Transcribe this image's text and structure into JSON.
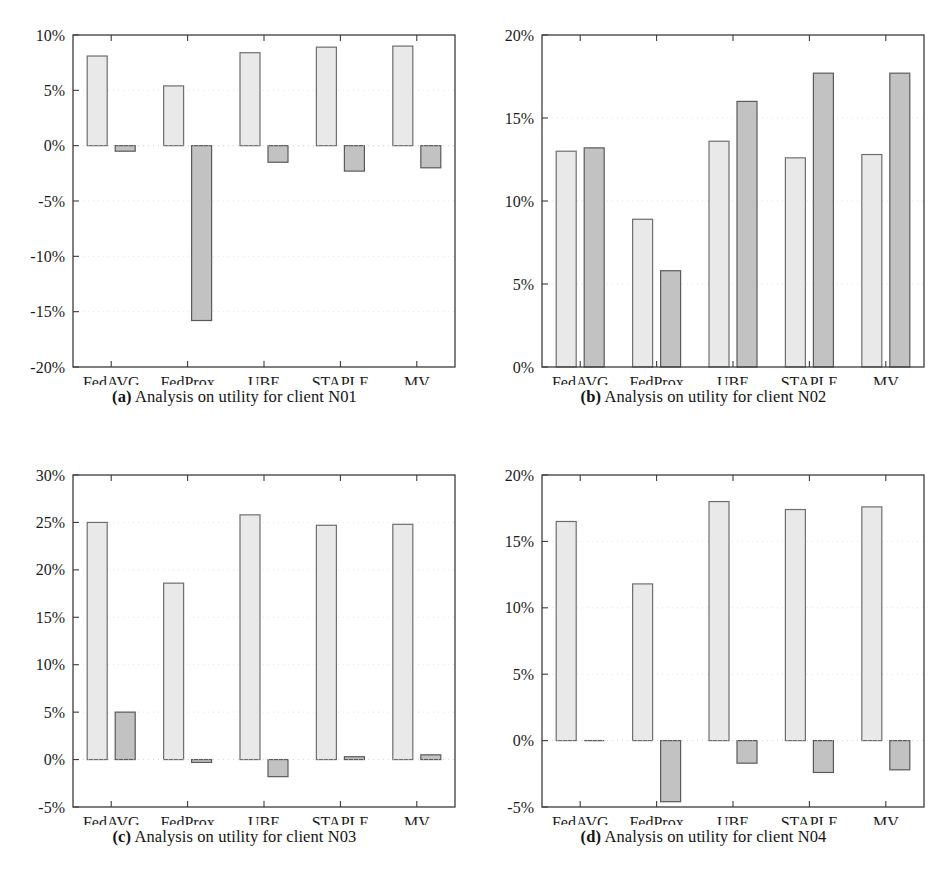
{
  "figure": {
    "panel_count": 4,
    "group_labels": [
      "FedAVG",
      "FedProx",
      "UBE",
      "STAPLE",
      "MV"
    ],
    "colors": {
      "series_light_fill": "#e9e9e9",
      "series_light_stroke": "#6e6e6e",
      "series_dark_fill": "#c2c2c2",
      "series_dark_stroke": "#5a5a5a",
      "axis": "#3c3c3c",
      "gridline": "#cfcfcf",
      "text": "#1a1a1a"
    }
  },
  "panels": [
    {
      "key": "a",
      "caption_tag": "(a)",
      "caption_text": "Analysis on utility for client N01",
      "chart_data": {
        "type": "bar",
        "title": "Analysis on utility for client N01",
        "xlabel": "",
        "ylabel": "",
        "categories": [
          "FedAVG",
          "FedProx",
          "UBE",
          "STAPLE",
          "MV"
        ],
        "series": [
          {
            "name": "series-light",
            "values": [
              8.1,
              5.4,
              8.4,
              8.9,
              9.0
            ]
          },
          {
            "name": "series-dark",
            "values": [
              -0.5,
              -15.8,
              -1.5,
              -2.3,
              -2.0
            ]
          }
        ],
        "ylim": [
          -20,
          10
        ],
        "ytick_values": [
          10,
          5,
          0,
          -5,
          -10,
          -15,
          -20
        ],
        "ytick_labels": [
          "10%",
          "5%",
          "0%",
          "-5%",
          "-10%",
          "-15%",
          "-20%"
        ],
        "grid": true,
        "legend": "none"
      }
    },
    {
      "key": "b",
      "caption_tag": "(b)",
      "caption_text": "Analysis on utility for client N02",
      "chart_data": {
        "type": "bar",
        "title": "Analysis on utility for client N02",
        "xlabel": "",
        "ylabel": "",
        "categories": [
          "FedAVG",
          "FedProx",
          "UBE",
          "STAPLE",
          "MV"
        ],
        "series": [
          {
            "name": "series-light",
            "values": [
              13.0,
              8.9,
              13.6,
              12.6,
              12.8
            ]
          },
          {
            "name": "series-dark",
            "values": [
              13.2,
              5.8,
              16.0,
              17.7,
              17.7
            ]
          }
        ],
        "ylim": [
          0,
          20
        ],
        "ytick_values": [
          20,
          15,
          10,
          5,
          0
        ],
        "ytick_labels": [
          "20%",
          "15%",
          "10%",
          "5%",
          "0%"
        ],
        "grid": true,
        "legend": "none"
      }
    },
    {
      "key": "c",
      "caption_tag": "(c)",
      "caption_text": "Analysis on utility for client N03",
      "chart_data": {
        "type": "bar",
        "title": "Analysis on utility for client N03",
        "xlabel": "",
        "ylabel": "",
        "categories": [
          "FedAVG",
          "FedProx",
          "UBE",
          "STAPLE",
          "MV"
        ],
        "series": [
          {
            "name": "series-light",
            "values": [
              25.0,
              18.6,
              25.8,
              24.7,
              24.8
            ]
          },
          {
            "name": "series-dark",
            "values": [
              5.0,
              -0.3,
              -1.8,
              0.3,
              0.5
            ]
          }
        ],
        "ylim": [
          -5,
          30
        ],
        "ytick_values": [
          30,
          25,
          20,
          15,
          10,
          5,
          0,
          -5
        ],
        "ytick_labels": [
          "30%",
          "25%",
          "20%",
          "15%",
          "10%",
          "5%",
          "0%",
          "-5%"
        ],
        "grid": true,
        "legend": "none"
      }
    },
    {
      "key": "d",
      "caption_tag": "(d)",
      "caption_text": "Analysis on utility for client N04",
      "chart_data": {
        "type": "bar",
        "title": "Analysis on utility for client N04",
        "xlabel": "",
        "ylabel": "",
        "categories": [
          "FedAVG",
          "FedProx",
          "UBE",
          "STAPLE",
          "MV"
        ],
        "series": [
          {
            "name": "series-light",
            "values": [
              16.5,
              11.8,
              18.0,
              17.4,
              17.6
            ]
          },
          {
            "name": "series-dark",
            "values": [
              0.0,
              -4.6,
              -1.7,
              -2.4,
              -2.2
            ]
          }
        ],
        "ylim": [
          -5,
          20
        ],
        "ytick_values": [
          20,
          15,
          10,
          5,
          0,
          -5
        ],
        "ytick_labels": [
          "20%",
          "15%",
          "10%",
          "5%",
          "0%",
          "-5%"
        ],
        "grid": true,
        "legend": "none"
      }
    }
  ]
}
